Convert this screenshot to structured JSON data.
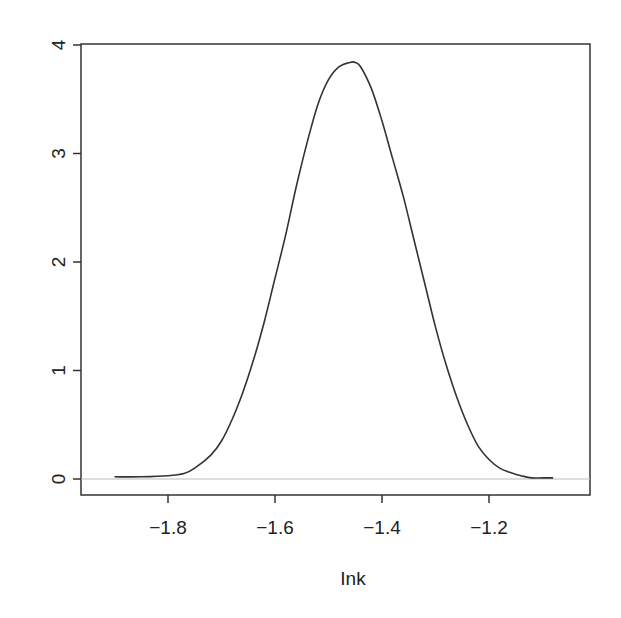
{
  "chart_data": {
    "type": "line",
    "title": "",
    "xlabel": "Ink",
    "ylabel": "",
    "xlim": [
      -1.92,
      -1.04
    ],
    "ylim": [
      -0.15,
      4.0
    ],
    "grid": false,
    "legend": null,
    "x_ticks": [
      "-1.8",
      "-1.6",
      "-1.4",
      "-1.2"
    ],
    "y_ticks": [
      "0",
      "1",
      "2",
      "3",
      "4"
    ],
    "series": [
      {
        "name": "density",
        "x": [
          -1.9,
          -1.85,
          -1.8,
          -1.77,
          -1.75,
          -1.72,
          -1.7,
          -1.68,
          -1.66,
          -1.64,
          -1.62,
          -1.6,
          -1.58,
          -1.56,
          -1.54,
          -1.52,
          -1.5,
          -1.48,
          -1.46,
          -1.45,
          -1.44,
          -1.42,
          -1.4,
          -1.38,
          -1.36,
          -1.34,
          -1.32,
          -1.3,
          -1.28,
          -1.26,
          -1.24,
          -1.22,
          -1.2,
          -1.18,
          -1.16,
          -1.14,
          -1.12,
          -1.1,
          -1.08
        ],
        "values": [
          0.02,
          0.02,
          0.03,
          0.05,
          0.1,
          0.22,
          0.35,
          0.55,
          0.8,
          1.1,
          1.45,
          1.85,
          2.25,
          2.7,
          3.1,
          3.45,
          3.68,
          3.8,
          3.84,
          3.84,
          3.8,
          3.6,
          3.3,
          2.95,
          2.6,
          2.2,
          1.8,
          1.4,
          1.05,
          0.75,
          0.5,
          0.3,
          0.18,
          0.1,
          0.06,
          0.03,
          0.01,
          0.01,
          0.01
        ]
      }
    ],
    "reference_lines": [
      {
        "axis": "y",
        "value": 0,
        "color": "#bbbbbb"
      }
    ]
  },
  "axes": {
    "x_title": "Ink",
    "x_tick_labels": [
      "−1.8",
      "−1.6",
      "−1.4",
      "−1.2"
    ],
    "y_tick_labels": [
      "0",
      "1",
      "2",
      "3",
      "4"
    ]
  }
}
